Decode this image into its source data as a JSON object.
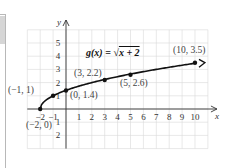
{
  "chart_data": {
    "type": "line",
    "function_label": "g(x) = √x + 2",
    "xlabel": "x",
    "ylabel": "y",
    "xlim": [
      -3,
      11
    ],
    "ylim": [
      -3,
      6
    ],
    "grid": true,
    "x_ticks": [
      "-2",
      "-1",
      "1",
      "2",
      "3",
      "4",
      "5",
      "6",
      "7",
      "8",
      "9",
      "10"
    ],
    "y_ticks": [
      "5",
      "4",
      "3",
      "2",
      "1",
      "-1",
      "-2"
    ],
    "points": [
      {
        "x": -2,
        "y": 0,
        "label": "(−2, 0)"
      },
      {
        "x": -1,
        "y": 1,
        "label": "(−1, 1)"
      },
      {
        "x": 0,
        "y": 1.4,
        "label": "(0, 1.4)"
      },
      {
        "x": 3,
        "y": 2.2,
        "label": "(3, 2.2)"
      },
      {
        "x": 5,
        "y": 2.6,
        "label": "(5, 2.6)"
      },
      {
        "x": 10,
        "y": 3.5,
        "label": "(10, 3.5)"
      }
    ]
  },
  "labels": {
    "title_g": "g",
    "title_x": "(x)",
    "title_eq": " = ",
    "title_rad": "x + 2",
    "axis_x": "x",
    "axis_y": "y",
    "p0": "(−2, 0)",
    "p1": "(−1, 1)",
    "p2": "(0, 1.4)",
    "p3": "(3, 2.2)",
    "p4": "(5, 2.6)",
    "p5": "(10, 3.5)"
  }
}
